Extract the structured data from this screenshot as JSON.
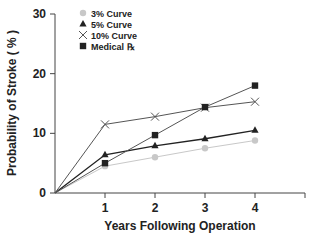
{
  "chart_data": {
    "type": "line",
    "title": "",
    "xlabel": "Years Following Operation",
    "ylabel": "Probability of Stroke ( % )",
    "x": [
      0,
      1,
      2,
      3,
      4
    ],
    "x_ticks": [
      "1",
      "2",
      "3",
      "4"
    ],
    "y_ticks": [
      "0",
      "10",
      "20",
      "30"
    ],
    "xlim": [
      0,
      5
    ],
    "ylim": [
      0,
      30
    ],
    "grid": false,
    "legend_position": "upper-left",
    "series": [
      {
        "name": "3% Curve",
        "marker": "circle",
        "color": "#c8c8c8",
        "values": [
          0,
          4.5,
          6.0,
          7.5,
          8.8
        ]
      },
      {
        "name": "5% Curve",
        "marker": "triangle",
        "color": "#222222",
        "values": [
          0,
          6.4,
          7.9,
          9.1,
          10.5
        ]
      },
      {
        "name": "10% Curve",
        "marker": "x",
        "color": "#555555",
        "values": [
          0,
          11.5,
          12.8,
          14.3,
          15.3
        ]
      },
      {
        "name": "Medical ℞",
        "marker": "square",
        "color": "#222222",
        "values": [
          0,
          5.0,
          9.7,
          14.4,
          18.0
        ]
      }
    ]
  }
}
